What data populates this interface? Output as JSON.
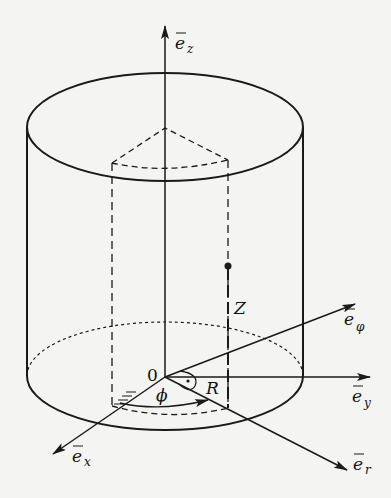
{
  "diagram": {
    "labels": {
      "ez": "e",
      "ez_sub": "z",
      "ey": "e",
      "ey_sub": "y",
      "ex": "e",
      "ex_sub": "x",
      "er": "e",
      "er_sub": "r",
      "ephi": "e",
      "ephi_sub": "φ",
      "origin": "0",
      "phi": "ϕ",
      "R": "R",
      "Z": "Z"
    },
    "colors": {
      "stroke": "#1a1a1a",
      "background": "#f4f4f2"
    }
  }
}
